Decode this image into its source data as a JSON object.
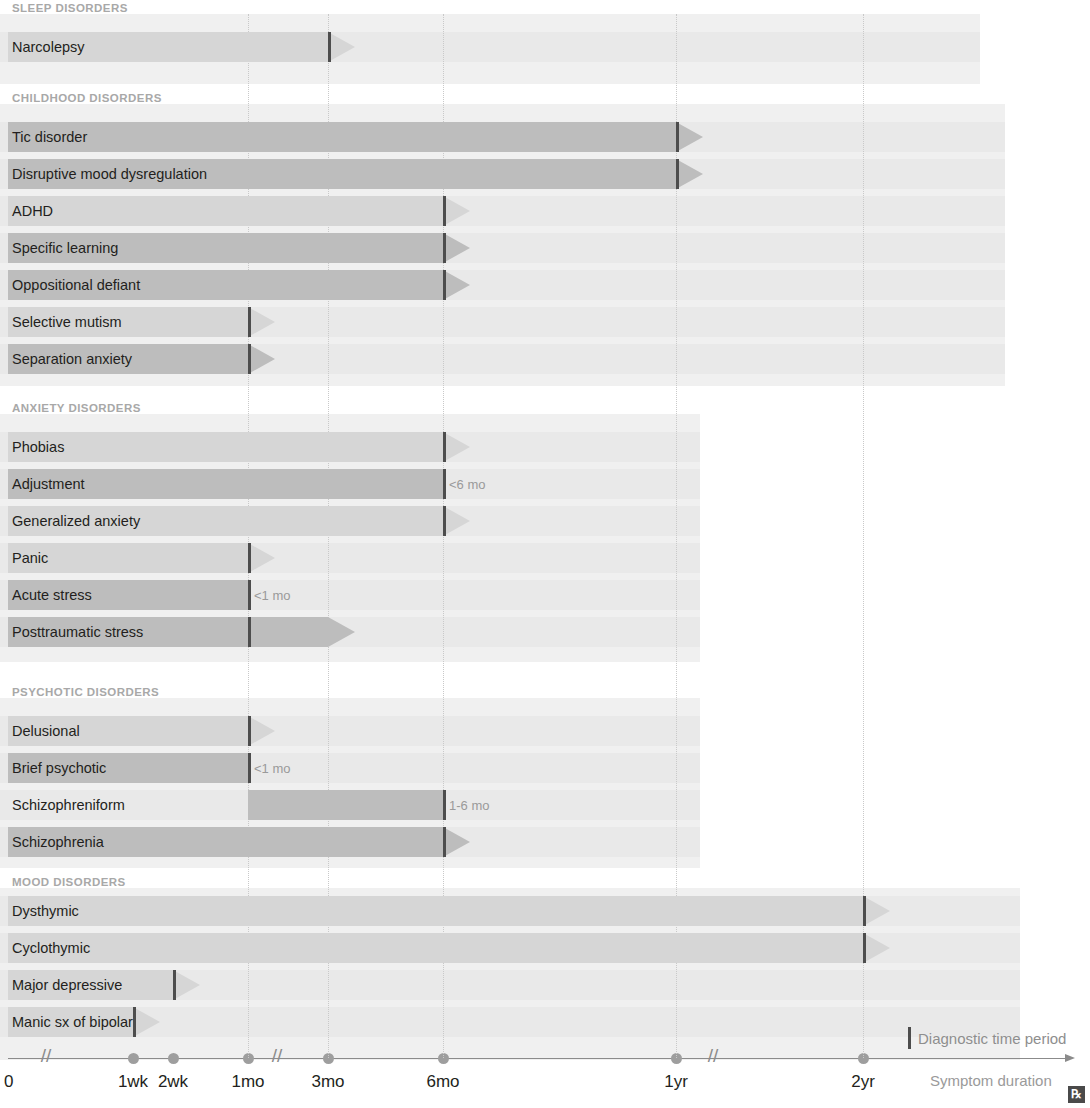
{
  "title_partial": "Diagnostic time periods",
  "axis": {
    "label": "Symptom duration",
    "zero_label": "0",
    "ticks": [
      {
        "label": "1wk",
        "x": 133
      },
      {
        "label": "2wk",
        "x": 173
      },
      {
        "label": "1mo",
        "x": 248
      },
      {
        "label": "3mo",
        "x": 328
      },
      {
        "label": "6mo",
        "x": 443
      },
      {
        "label": "1yr",
        "x": 676
      },
      {
        "label": "2yr",
        "x": 863
      }
    ],
    "breaks_x": [
      46,
      277,
      713
    ],
    "gridlines_x": [
      248,
      328,
      443,
      676,
      863
    ]
  },
  "legend": {
    "marker_label": "Diagnostic time period"
  },
  "icons": {
    "rx": "rx-icon",
    "rx_glyph": "℞"
  },
  "colors": {
    "bar_light": "#d6d6d6",
    "bar_dark": "#bdbdbd",
    "row_bg": "#e9e9e9",
    "band_bg": "#f0f0f0",
    "marker": "#4d4d4d",
    "section_heading": "#a8a8a8",
    "note_text": "#9a9a9a"
  },
  "chart_data": {
    "type": "bar",
    "title": "Diagnostic time periods",
    "xlabel": "Symptom duration",
    "ylabel": "",
    "grid": true,
    "legend_position": "bottom-right",
    "x_tick_labels": [
      "0",
      "1wk",
      "2wk",
      "1mo",
      "3mo",
      "6mo",
      "1yr",
      "2yr"
    ],
    "x_tick_px": [
      10,
      133,
      173,
      248,
      328,
      443,
      676,
      863
    ],
    "note": "Horizontal timeline bars; dark vertical marker = diagnostic time threshold; arrow tip = ongoing/continuing duration.",
    "sections": [
      {
        "name": "SLEEP DISORDERS",
        "rows": [
          {
            "label": "Narcolepsy",
            "start": "0",
            "marker": "3mo",
            "end": "3mo",
            "continues": true,
            "tone": "light",
            "note": ""
          }
        ]
      },
      {
        "name": "CHILDHOOD DISORDERS",
        "rows": [
          {
            "label": "Tic disorder",
            "start": "0",
            "marker": "1yr",
            "end": "1yr",
            "continues": true,
            "tone": "dark",
            "note": ""
          },
          {
            "label": "Disruptive mood dysregulation",
            "start": "0",
            "marker": "1yr",
            "end": "1yr",
            "continues": true,
            "tone": "dark",
            "note": ""
          },
          {
            "label": "ADHD",
            "start": "0",
            "marker": "6mo",
            "end": "6mo",
            "continues": true,
            "tone": "light",
            "note": ""
          },
          {
            "label": "Specific learning",
            "start": "0",
            "marker": "6mo",
            "end": "6mo",
            "continues": true,
            "tone": "dark",
            "note": ""
          },
          {
            "label": "Oppositional defiant",
            "start": "0",
            "marker": "6mo",
            "end": "6mo",
            "continues": true,
            "tone": "dark",
            "note": ""
          },
          {
            "label": "Selective mutism",
            "start": "0",
            "marker": "1mo",
            "end": "1mo",
            "continues": true,
            "tone": "light",
            "note": ""
          },
          {
            "label": "Separation anxiety",
            "start": "0",
            "marker": "1mo",
            "end": "1mo",
            "continues": true,
            "tone": "dark",
            "note": ""
          }
        ]
      },
      {
        "name": "ANXIETY DISORDERS",
        "rows": [
          {
            "label": "Phobias",
            "start": "0",
            "marker": "6mo",
            "end": "6mo",
            "continues": true,
            "tone": "light",
            "note": ""
          },
          {
            "label": "Adjustment",
            "start": "0",
            "marker": "6mo",
            "end": "6mo",
            "continues": false,
            "tone": "dark",
            "note": "<6 mo"
          },
          {
            "label": "Generalized anxiety",
            "start": "0",
            "marker": "6mo",
            "end": "6mo",
            "continues": true,
            "tone": "light",
            "note": ""
          },
          {
            "label": "Panic",
            "start": "0",
            "marker": "1mo",
            "end": "1mo",
            "continues": true,
            "tone": "light",
            "note": ""
          },
          {
            "label": "Acute stress",
            "start": "0",
            "marker": "1mo",
            "end": "1mo",
            "continues": false,
            "tone": "dark",
            "note": "<1 mo"
          },
          {
            "label": "Posttraumatic stress",
            "start": "0",
            "marker": "1mo",
            "end": "3mo",
            "continues": true,
            "tone": "dark",
            "note": ""
          }
        ]
      },
      {
        "name": "PSYCHOTIC DISORDERS",
        "rows": [
          {
            "label": "Delusional",
            "start": "0",
            "marker": "1mo",
            "end": "1mo",
            "continues": true,
            "tone": "light",
            "note": ""
          },
          {
            "label": "Brief psychotic",
            "start": "0",
            "marker": "1mo",
            "end": "1mo",
            "continues": false,
            "tone": "dark",
            "note": "<1 mo"
          },
          {
            "label": "Schizophreniform",
            "start": "1mo",
            "marker": "6mo",
            "end": "6mo",
            "continues": false,
            "tone": "dark",
            "note": "1-6 mo"
          },
          {
            "label": "Schizophrenia",
            "start": "0",
            "marker": "6mo",
            "end": "6mo",
            "continues": true,
            "tone": "dark",
            "note": ""
          }
        ]
      },
      {
        "name": "MOOD DISORDERS",
        "rows": [
          {
            "label": "Dysthymic",
            "start": "0",
            "marker": "2yr",
            "end": "2yr",
            "continues": true,
            "tone": "light",
            "note": ""
          },
          {
            "label": "Cyclothymic",
            "start": "0",
            "marker": "2yr",
            "end": "2yr",
            "continues": true,
            "tone": "light",
            "note": ""
          },
          {
            "label": "Major depressive",
            "start": "0",
            "marker": "2wk",
            "end": "2wk",
            "continues": true,
            "tone": "light",
            "note": ""
          },
          {
            "label": "Manic sx of bipolar",
            "start": "0",
            "marker": "1wk",
            "end": "1wk",
            "continues": true,
            "tone": "light",
            "note": ""
          }
        ]
      }
    ]
  },
  "layout": {
    "sections": [
      {
        "head_y": 2,
        "band_top": 14,
        "band_h": 70,
        "band_w": 980,
        "rows_top": 32,
        "rows": [
          {
            "y": 32
          }
        ]
      },
      {
        "head_y": 92,
        "band_top": 104,
        "band_h": 282,
        "band_w": 1005,
        "rows_top": 122,
        "rows": [
          {
            "y": 122
          },
          {
            "y": 159
          },
          {
            "y": 196
          },
          {
            "y": 233
          },
          {
            "y": 270
          },
          {
            "y": 307
          },
          {
            "y": 344
          }
        ]
      },
      {
        "head_y": 402,
        "band_top": 414,
        "band_h": 248,
        "band_w": 700,
        "rows_top": 432,
        "rows": [
          {
            "y": 432
          },
          {
            "y": 469
          },
          {
            "y": 506
          },
          {
            "y": 543
          },
          {
            "y": 580
          },
          {
            "y": 617
          }
        ]
      },
      {
        "head_y": 686,
        "band_top": 698,
        "band_h": 170,
        "band_w": 700,
        "rows_top": 716,
        "rows": [
          {
            "y": 716
          },
          {
            "y": 753
          },
          {
            "y": 790
          },
          {
            "y": 827
          }
        ]
      },
      {
        "head_y": 876,
        "band_top": 888,
        "band_h": 172,
        "band_w": 1020,
        "rows_top": 896,
        "rows": [
          {
            "y": 896
          },
          {
            "y": 933
          },
          {
            "y": 970
          },
          {
            "y": 1007
          }
        ]
      }
    ],
    "row_width_default": 1000,
    "axis_y": 1058,
    "axis_x0": 8,
    "axis_x1": 1065
  }
}
